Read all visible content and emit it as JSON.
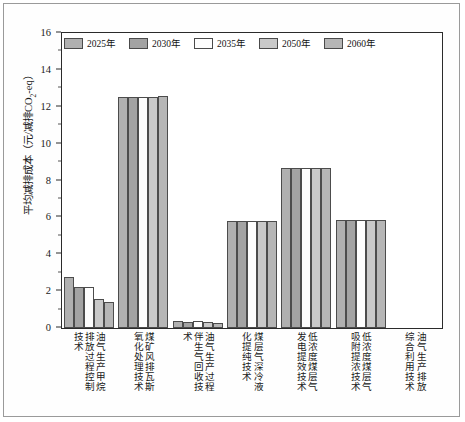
{
  "chart_data": {
    "type": "bar",
    "title": "",
    "xlabel": "",
    "ylabel": "平均减排成本（元/减排CO₂-eq）",
    "ylabel_main": "平均减排成本（元/减排CO",
    "ylabel_sub": "2",
    "ylabel_tail": "-eq）",
    "ylim": [
      0,
      16
    ],
    "ytick_values": [
      0,
      2,
      4,
      6,
      8,
      10,
      12,
      14,
      16
    ],
    "ytick_labels": [
      "0",
      "2",
      "4",
      "6",
      "8",
      "10",
      "12",
      "14",
      "16"
    ],
    "grid": false,
    "legend_position": "top-center",
    "categories": [
      "油气生产甲烷排放过程控制技术",
      "煤矿风排瓦斯氧化处理技术",
      "油气生产过程伴生气回收技术",
      "煤层气深冷液化提纯技术",
      "低浓度煤层气发电提效技术",
      "低浓度煤层气吸附提浓技术",
      "油气生产排放综合利用技术"
    ],
    "category_columns": [
      [
        "油气生产甲烷",
        "排放过程控制",
        "技术"
      ],
      [
        "煤矿风排瓦斯",
        "氧化处理技术"
      ],
      [
        "油气生产过程",
        "伴生气回收技",
        "术"
      ],
      [
        "煤层气深冷液",
        "化提纯技术"
      ],
      [
        "低浓度煤层气",
        "发电提效技术"
      ],
      [
        "低浓度煤层气",
        "吸附提浓技术"
      ],
      [
        "油气生产排放",
        "综合利用技术"
      ]
    ],
    "series": [
      {
        "name": "2025年",
        "color": "#b0b0b0",
        "values": [
          2.75,
          12.55,
          0.38,
          5.78,
          8.68,
          5.85,
          0
        ]
      },
      {
        "name": "2030年",
        "color": "#a3a3a3",
        "values": [
          2.2,
          12.55,
          0.35,
          5.78,
          8.68,
          5.85,
          0
        ]
      },
      {
        "name": "2035年",
        "color": "#fdfdfd",
        "values": [
          2.2,
          12.55,
          0.37,
          5.78,
          8.68,
          5.85,
          0
        ]
      },
      {
        "name": "2050年",
        "color": "#c9c9c9",
        "values": [
          1.6,
          12.55,
          0.3,
          5.78,
          8.68,
          5.85,
          0
        ]
      },
      {
        "name": "2060年",
        "color": "#b6b6b6",
        "values": [
          1.42,
          12.58,
          0.28,
          5.8,
          8.7,
          5.87,
          0
        ]
      }
    ]
  },
  "legend": {
    "items": [
      "2025年",
      "2030年",
      "2035年",
      "2050年",
      "2060年"
    ]
  },
  "colors": {
    "axis": "#2b2b2b",
    "frame": "#9a9a9a",
    "background": "#ffffff",
    "bar_border": "#4c4c4c"
  }
}
